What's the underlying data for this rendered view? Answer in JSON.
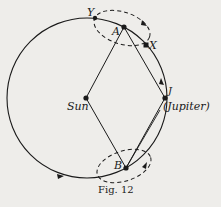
{
  "figure": {
    "caption": "Fig. 12",
    "labels": {
      "sun": "Sun",
      "jupiter_letter": "J",
      "jupiter_name": "(Jupiter)",
      "a": "A",
      "b": "B",
      "x": "X",
      "y": "Y"
    },
    "points": {
      "sun": [
        86,
        98
      ],
      "jupiter": [
        165,
        98
      ],
      "a": [
        124,
        27
      ],
      "b": [
        126,
        168
      ],
      "x": [
        146,
        45
      ],
      "y": [
        95,
        18
      ]
    },
    "orbit": {
      "cx": 87,
      "cy": 98,
      "r": 80
    },
    "colors": {
      "ink": "#1a1a1a",
      "paper": "#eeedea"
    }
  }
}
